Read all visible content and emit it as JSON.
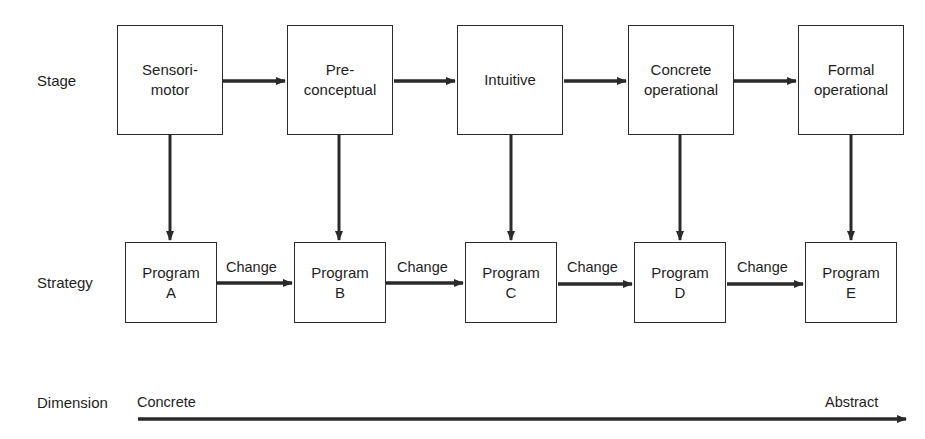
{
  "rows": {
    "stage_label": "Stage",
    "strategy_label": "Strategy",
    "dimension_label": "Dimension"
  },
  "stages": [
    {
      "line1": "Sensori-",
      "line2": "motor"
    },
    {
      "line1": "Pre-",
      "line2": "conceptual"
    },
    {
      "line1": "Intuitive",
      "line2": ""
    },
    {
      "line1": "Concrete",
      "line2": "operational"
    },
    {
      "line1": "Formal",
      "line2": "operational"
    }
  ],
  "programs": [
    {
      "line1": "Program",
      "line2": "A"
    },
    {
      "line1": "Program",
      "line2": "B"
    },
    {
      "line1": "Program",
      "line2": "C"
    },
    {
      "line1": "Program",
      "line2": "D"
    },
    {
      "line1": "Program",
      "line2": "E"
    }
  ],
  "transitions": [
    "Change",
    "Change",
    "Change",
    "Change"
  ],
  "dimension": {
    "start": "Concrete",
    "end": "Abstract"
  },
  "colors": {
    "stroke": "#2a2a2a",
    "text": "#1e1e1e",
    "background": "#ffffff"
  }
}
